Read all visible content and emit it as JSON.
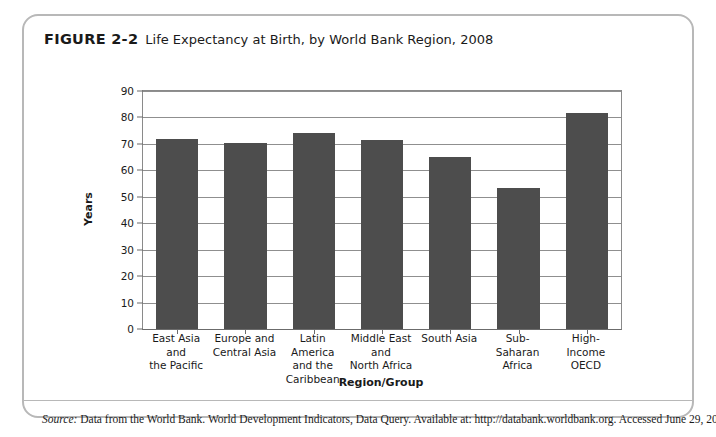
{
  "figure": {
    "label": "FIGURE 2-2",
    "caption": "Life Expectancy at Birth, by World Bank Region, 2008",
    "source_word": "Source:",
    "source_text": "Data from the World Bank. World Development Indicators, Data Query. Available at: http://databank.worldbank.org. Accessed June 29, 2010."
  },
  "chart_data": {
    "type": "bar",
    "title": "Life Expectancy at Birth, by World Bank Region, 2008",
    "xlabel": "Region/Group",
    "ylabel": "Years",
    "ylim": [
      0,
      90
    ],
    "ytick_step": 10,
    "yticks": [
      0,
      10,
      20,
      30,
      40,
      50,
      60,
      70,
      80,
      90
    ],
    "grid": true,
    "legend": "none",
    "bar_color": "#4d4d4d",
    "categories": [
      "East Asia and the Pacific",
      "Europe and Central Asia",
      "Latin America and the Caribbean",
      "Middle East and North Africa",
      "South Asia",
      "Sub-Saharan Africa",
      "High-Income OECD"
    ],
    "category_lines": [
      [
        "East Asia and",
        "the Pacific"
      ],
      [
        "Europe and",
        "Central Asia"
      ],
      [
        "Latin America",
        "and the",
        "Caribbean"
      ],
      [
        "Middle East",
        "and",
        "North Africa"
      ],
      [
        "South Asia"
      ],
      [
        "Sub-Saharan",
        "Africa"
      ],
      [
        "High-Income",
        "OECD"
      ]
    ],
    "values": [
      72,
      70.3,
      74,
      71.3,
      65,
      53.3,
      81.5
    ]
  }
}
